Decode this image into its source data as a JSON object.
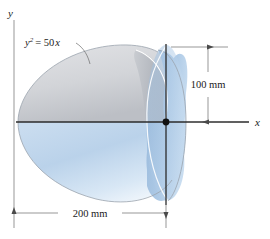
{
  "figure": {
    "type": "engineering-diagram",
    "axes": {
      "y_label": "y",
      "x_label": "x"
    },
    "curve_equation": {
      "base": "y",
      "exponent": "2",
      "relation": "= 50",
      "variable": "x"
    },
    "dimensions": [
      {
        "name": "height-dimension",
        "label": "100 mm",
        "value": 100,
        "unit": "mm",
        "orientation": "vertical"
      },
      {
        "name": "length-dimension",
        "label": "200 mm",
        "value": 200,
        "unit": "mm",
        "orientation": "horizontal"
      }
    ],
    "colors": {
      "cut_surface_top": "#d9dade",
      "cut_surface_bottom": "#bdc0c6",
      "solid_blue_light": "#e4eef8",
      "solid_blue_mid": "#b9d0e8",
      "solid_blue_dark": "#9dbcdd",
      "end_cap": "#a9c6e4",
      "axis": "#2b2b2b",
      "dimension_line": "#6b6b6b",
      "background": "#ffffff"
    },
    "origin_marker": "origin-dot"
  }
}
